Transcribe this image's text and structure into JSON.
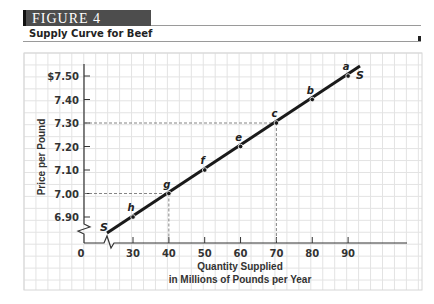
{
  "header": {
    "figure_label": "FIGURE 4",
    "title": "Supply Curve for Beef"
  },
  "chart_data": {
    "type": "line",
    "title": "Supply Curve for Beef",
    "xlabel": "Quantity Supplied in Millions of Pounds per Year",
    "xlabel_lines": [
      "Quantity Supplied",
      "in Millions of Pounds per Year"
    ],
    "ylabel": "Price per Pound",
    "x_origin_label": "0",
    "x_ticks": [
      "30",
      "40",
      "50",
      "60",
      "70",
      "80",
      "90"
    ],
    "y_ticks": [
      "$7.50",
      "7.40",
      "7.30",
      "7.20",
      "7.10",
      "7.00",
      "6.90"
    ],
    "xlim": [
      0,
      100
    ],
    "ylim": [
      6.8,
      7.55
    ],
    "grid": true,
    "axis_breaks": {
      "x": true,
      "y": true
    },
    "series": [
      {
        "name": "S",
        "points": [
          {
            "label": "h",
            "x": 30,
            "y": 6.9
          },
          {
            "label": "g",
            "x": 40,
            "y": 7.0
          },
          {
            "label": "f",
            "x": 50,
            "y": 7.1
          },
          {
            "label": "e",
            "x": 60,
            "y": 7.2
          },
          {
            "label": "c",
            "x": 70,
            "y": 7.3
          },
          {
            "label": "b",
            "x": 80,
            "y": 7.4
          },
          {
            "label": "a",
            "x": 90,
            "y": 7.5
          }
        ]
      }
    ],
    "curve_labels": [
      "S",
      "S"
    ],
    "reference_lines": [
      {
        "point": "g",
        "x": 40,
        "y": 7.0,
        "style": "dashed"
      },
      {
        "point": "c",
        "x": 70,
        "y": 7.3,
        "style": "dashed"
      }
    ]
  }
}
